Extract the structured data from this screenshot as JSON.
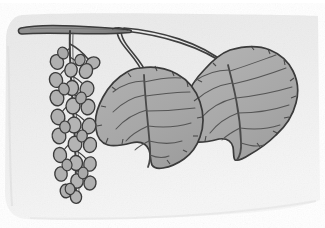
{
  "image": {
    "kind": "botanical-illustration",
    "subject": "aspen / poplar twig with two leaves and a seed catkin",
    "width": 325,
    "height": 228,
    "medium": "pencil and gray wash drawing on paper"
  },
  "palette": {
    "page_background": "#ffffff",
    "paper_background": "#ebebeb",
    "paper_background_light": "#f2f2f2",
    "paper_shadow": "#e2e2e2",
    "leaf_fill": "#a9a9a9",
    "leaf_fill_shadow": "#9c9c9c",
    "leaf_outline": "#3a3a3a",
    "vein_stroke": "#555555",
    "branch_fill": "#8f8f8f",
    "branch_outline": "#3a3a3a",
    "stem_stroke": "#3f3f3f",
    "pod_fill": "#b0b0b0",
    "pod_outline": "#3c3c3c"
  },
  "paper": {
    "name": "textured drawing paper",
    "x": 4,
    "y": 14,
    "width": 318,
    "height": 208,
    "corner_radius": 16
  },
  "branch": {
    "label": "main woody branch",
    "from_x": 20,
    "to_x": 128,
    "y": 30,
    "thickness": 7
  },
  "catkin": {
    "label": "hanging seed catkin",
    "stem_top_x": 70,
    "stem_top_y": 31,
    "stem_bottom_x": 76,
    "stem_bottom_y": 198,
    "pod_count": 34,
    "pod_shape": "oval seed pod"
  },
  "bud": {
    "label": "small side bud",
    "cx": 92,
    "cy": 62,
    "rx": 7,
    "ry": 6
  },
  "leaves": [
    {
      "name": "left-leaf",
      "label": "left ovate leaf",
      "center_x": 150,
      "center_y": 116,
      "width": 112,
      "height": 108,
      "petiole_from_x": 118,
      "petiole_from_y": 30,
      "vein_pairs": 6,
      "margin": "crenate-serrate"
    },
    {
      "name": "right-leaf",
      "label": "right ovate leaf",
      "center_x": 242,
      "center_y": 104,
      "width": 114,
      "height": 112,
      "petiole_from_x": 128,
      "petiole_from_y": 29,
      "vein_pairs": 6,
      "margin": "crenate-serrate"
    }
  ],
  "caption": {
    "alt_text": "Grayscale botanical drawing of an aspen twig bearing two heart-shaped leaves on curving stalks and a long pendulous catkin of oval seed pods."
  }
}
